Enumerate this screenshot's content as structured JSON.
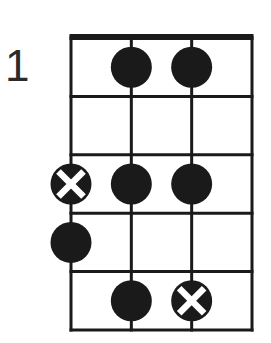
{
  "diagram": {
    "type": "fretboard-scale-box",
    "start_fret_label": "1",
    "strings": 4,
    "frets_shown": 5,
    "colors": {
      "line": "#1a1a1a",
      "dot": "#1a1a1a",
      "root_mark": "#ffffff",
      "background": "#ffffff"
    },
    "notes": [
      {
        "fret": 1,
        "string": 2,
        "kind": "dot"
      },
      {
        "fret": 1,
        "string": 3,
        "kind": "dot"
      },
      {
        "fret": 3,
        "string": 1,
        "kind": "root-x"
      },
      {
        "fret": 3,
        "string": 2,
        "kind": "dot"
      },
      {
        "fret": 3,
        "string": 3,
        "kind": "dot"
      },
      {
        "fret": 4,
        "string": 1,
        "kind": "dot"
      },
      {
        "fret": 5,
        "string": 2,
        "kind": "dot"
      },
      {
        "fret": 5,
        "string": 3,
        "kind": "root-x"
      }
    ]
  }
}
